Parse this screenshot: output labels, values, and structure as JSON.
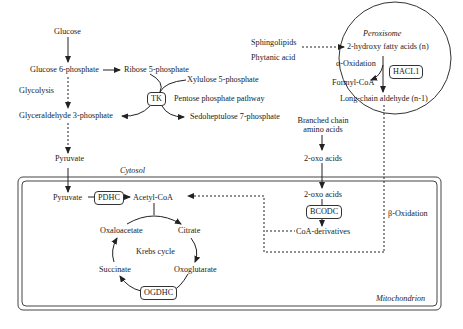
{
  "diagram": {
    "compartments": {
      "cytosol": "Cytosol",
      "mitochondrion": "Mitochondrion",
      "peroxisome": "Peroxisome"
    },
    "glycolysis": {
      "glucose": "Glucose",
      "g6p": "Glucose 6-phosphate",
      "label": "Glycolysis",
      "g3p": "Glyceraldehyde 3-phosphate",
      "pyruvate": "Pyruvate"
    },
    "pentose_phosphate": {
      "ribose5p": "Ribose 5-phosphate",
      "xylulose5p": "Xylulose 5-phosphate",
      "enzyme": "TK",
      "label": "Pentose phosphate pathway",
      "sedoheptulose7p": "Sedoheptulose 7-phosphate"
    },
    "peroxisome": {
      "sphingolipids": "Sphingolipids",
      "phytanic_acid": "Phytanic acid",
      "hydroxy_fa": "2-hydroxy fatty acids (n)",
      "alpha_ox": "α-Oxidation",
      "enzyme": "HACL1",
      "formyl_coa": "Formyl-CoA",
      "aldehyde": "Long-chain aldehyde (n-1)"
    },
    "branched_chain": {
      "bcaa_line1": "Branched chain",
      "bcaa_line2": "amino acids",
      "oxo_acids_cyto": "2-oxo acids",
      "oxo_acids_mito": "2-oxo acids",
      "enzyme": "BCODC",
      "coa_derivatives": "CoA-derivatives",
      "beta_ox": "β-Oxidation"
    },
    "mitochondrion": {
      "pyruvate": "Pyruvate",
      "pdhc": "PDHC",
      "acetyl_coa": "Acetyl-CoA",
      "krebs": "Krebs cycle",
      "citrate": "Citrate",
      "oxoglutarate": "Oxoglutarate",
      "ogdhc": "OGDHC",
      "succinate": "Succinate",
      "oxaloacetate": "Oxaloacetate"
    }
  }
}
